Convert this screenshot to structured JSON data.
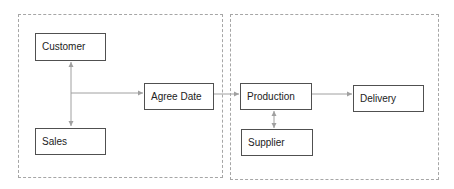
{
  "diagram": {
    "groups": [
      {
        "id": "group-sales-side"
      },
      {
        "id": "group-production-side"
      }
    ],
    "nodes": {
      "customer": {
        "label": "Customer"
      },
      "sales": {
        "label": "Sales"
      },
      "agree_date": {
        "label": "Agree Date"
      },
      "production": {
        "label": "Production"
      },
      "supplier": {
        "label": "Supplier"
      },
      "delivery": {
        "label": "Delivery"
      }
    },
    "edges": [
      {
        "from": "customer",
        "to": "sales",
        "type": "bidirectional"
      },
      {
        "from": "customer-sales-link",
        "to": "agree_date",
        "type": "arrow"
      },
      {
        "from": "agree_date",
        "to": "production",
        "type": "arrow"
      },
      {
        "from": "production",
        "to": "supplier",
        "type": "bidirectional"
      },
      {
        "from": "production",
        "to": "delivery",
        "type": "arrow"
      }
    ],
    "colors": {
      "node_border": "#505050",
      "edge": "#a0a0a0",
      "group_border": "#a6a6a6"
    }
  }
}
